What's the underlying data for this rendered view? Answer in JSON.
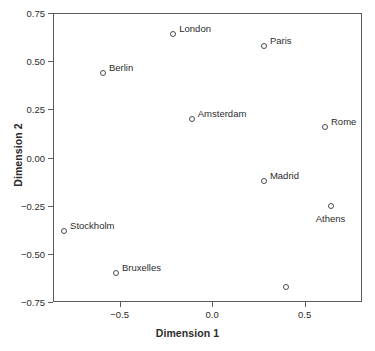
{
  "chart_data": {
    "type": "scatter",
    "title": "",
    "xlabel": "Dimension 1",
    "ylabel": "Dimension 2",
    "xlim": [
      -0.86,
      0.81
    ],
    "ylim": [
      -0.75,
      0.75
    ],
    "xticks": [
      "-0.5",
      "0.0",
      "0.5"
    ],
    "xtick_values": [
      -0.5,
      0.0,
      0.5
    ],
    "yticks": [
      "0.75",
      "0.50",
      "0.25",
      "0.00",
      "-0.25",
      "-0.50",
      "-0.75"
    ],
    "ytick_values": [
      0.75,
      0.5,
      0.25,
      0.0,
      -0.25,
      -0.5,
      -0.75
    ],
    "grid": false,
    "legend": "none",
    "marker_color": "#4a4a52",
    "points": [
      {
        "label": "London",
        "x": -0.21,
        "y": 0.64,
        "label_pos": "right"
      },
      {
        "label": "Paris",
        "x": 0.28,
        "y": 0.58,
        "label_pos": "right"
      },
      {
        "label": "Berlin",
        "x": -0.59,
        "y": 0.44,
        "label_pos": "right"
      },
      {
        "label": "Amsterdam",
        "x": -0.11,
        "y": 0.2,
        "label_pos": "right"
      },
      {
        "label": "Rome",
        "x": 0.61,
        "y": 0.16,
        "label_pos": "right"
      },
      {
        "label": "Madrid",
        "x": 0.28,
        "y": -0.12,
        "label_pos": "right"
      },
      {
        "label": "Athens",
        "x": 0.64,
        "y": -0.25,
        "label_pos": "below"
      },
      {
        "label": "Stockholm",
        "x": -0.8,
        "y": -0.38,
        "label_pos": "right"
      },
      {
        "label": "Bruxelles",
        "x": -0.52,
        "y": -0.6,
        "label_pos": "right"
      },
      {
        "label": "",
        "x": 0.4,
        "y": -0.67,
        "label_pos": "none"
      }
    ]
  }
}
